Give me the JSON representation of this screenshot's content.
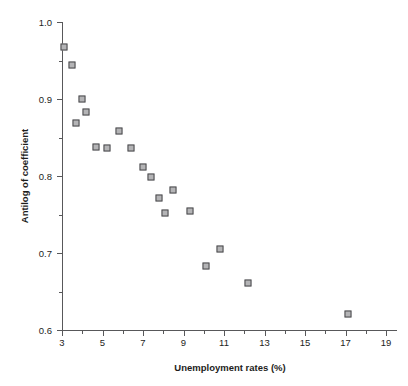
{
  "chart_data": {
    "type": "scatter",
    "title": "",
    "xlabel": "Unemployment rates (%)",
    "ylabel": "Antilog of coefficient",
    "xlim": [
      3,
      19.6
    ],
    "ylim": [
      0.6,
      1.0
    ],
    "grid": false,
    "legend": null,
    "x_ticks_major": [
      3,
      5,
      7,
      9,
      11,
      13,
      15,
      17,
      19
    ],
    "x_tick_labels": [
      "3",
      "5",
      "7",
      "9",
      "11",
      "13",
      "15",
      "17",
      "19"
    ],
    "x_ticks_minor": [
      4,
      6,
      8,
      10,
      12,
      14,
      16,
      18
    ],
    "y_ticks_major": [
      0.6,
      0.7,
      0.8,
      0.9,
      1.0
    ],
    "y_tick_labels": [
      "0.6",
      "0.7",
      "0.8",
      "0.9",
      "1.0"
    ],
    "y_ticks_minor": [
      0.65,
      0.75,
      0.85,
      0.95
    ],
    "marker": "open-square",
    "marker_edge_color": "#4a4a4c",
    "marker_fill_color": "#b4b4b6",
    "axis_color": "#58585a",
    "background_color": "#ffffff",
    "points": [
      {
        "x": 3.1,
        "y": 0.967
      },
      {
        "x": 3.5,
        "y": 0.944
      },
      {
        "x": 3.7,
        "y": 0.869
      },
      {
        "x": 4.0,
        "y": 0.9
      },
      {
        "x": 4.2,
        "y": 0.883
      },
      {
        "x": 4.7,
        "y": 0.838
      },
      {
        "x": 5.2,
        "y": 0.836
      },
      {
        "x": 5.8,
        "y": 0.859
      },
      {
        "x": 6.4,
        "y": 0.836
      },
      {
        "x": 7.0,
        "y": 0.812
      },
      {
        "x": 7.4,
        "y": 0.799
      },
      {
        "x": 7.8,
        "y": 0.771
      },
      {
        "x": 8.1,
        "y": 0.752
      },
      {
        "x": 8.5,
        "y": 0.782
      },
      {
        "x": 9.3,
        "y": 0.754
      },
      {
        "x": 10.1,
        "y": 0.683
      },
      {
        "x": 10.8,
        "y": 0.705
      },
      {
        "x": 12.2,
        "y": 0.661
      },
      {
        "x": 17.1,
        "y": 0.621
      }
    ]
  }
}
